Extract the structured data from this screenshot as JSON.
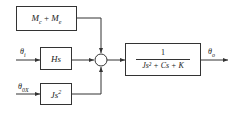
{
  "diagram": {
    "blocks": {
      "disturbance": {
        "main": "M",
        "sub1": "c",
        "plus": " + ",
        "main2": "M",
        "sub2": "e"
      },
      "hs": {
        "text": "Hs"
      },
      "js2": {
        "text": "Js",
        "sup": "2"
      },
      "plant": {
        "numerator": "1",
        "denominator": "Js² + Cs + K"
      }
    },
    "signals": {
      "input1": {
        "symbol": "θ",
        "sub": "i"
      },
      "input2": {
        "symbol": "θ",
        "sub": "0X"
      },
      "output": {
        "symbol": "θ",
        "sub": "o"
      }
    },
    "summing_junction": {
      "shape": "circle"
    }
  }
}
